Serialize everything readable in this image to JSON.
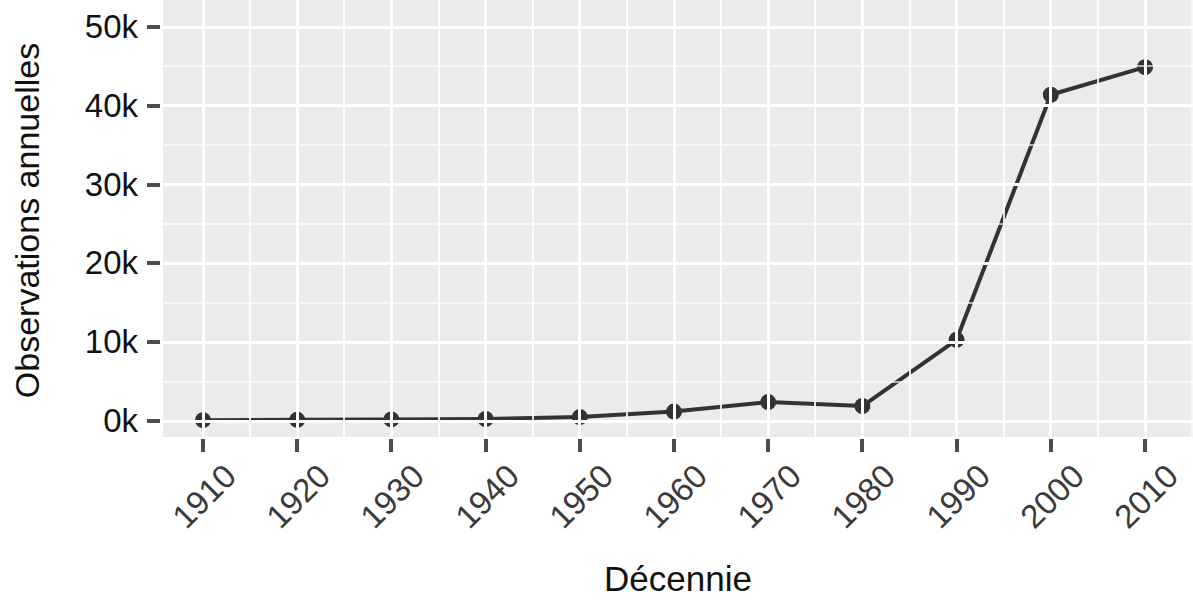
{
  "chart_data": {
    "type": "line",
    "title": "",
    "subtitle": "",
    "xlabel": "Décennie",
    "ylabel": "Observations annuelles",
    "categories": [
      "1910",
      "1920",
      "1930",
      "1940",
      "1950",
      "1960",
      "1970",
      "1980",
      "1990",
      "2000",
      "2010"
    ],
    "x": [
      1910,
      1920,
      1930,
      1940,
      1950,
      1960,
      1970,
      1980,
      1990,
      2000,
      2010
    ],
    "values": [
      100,
      150,
      200,
      250,
      500,
      1200,
      2400,
      1900,
      10300,
      41400,
      44900
    ],
    "series": [
      {
        "name": "Observations annuelles",
        "values": [
          100,
          150,
          200,
          250,
          500,
          1200,
          2400,
          1900,
          10300,
          41400,
          44900
        ]
      }
    ],
    "xlim": [
      1905,
      2015
    ],
    "ylim": [
      -2000,
      53400
    ],
    "ytick_values": [
      0,
      10000,
      20000,
      30000,
      40000,
      50000
    ],
    "ytick_labels": [
      "0k",
      "10k",
      "20k",
      "30k",
      "40k",
      "50k"
    ],
    "xtick_labels": [
      "1910",
      "1920",
      "1930",
      "1940",
      "1950",
      "1960",
      "1970",
      "1980",
      "1990",
      "2000",
      "2010"
    ],
    "xtick_label_rotation": -45,
    "grid": true,
    "grid_major_color": "#ffffff",
    "grid_minor_color": "#ffffff",
    "panel_background": "#ebebeb",
    "figure_background": "#ffffff",
    "line_color": "#333333",
    "point_color": "#333333",
    "line_width": 4,
    "point_radius": 8,
    "legend": "none",
    "markers": "circle"
  },
  "axes": {
    "y_title": "Observations annuelles",
    "x_title": "Décennie",
    "y_ticks": [
      {
        "label": "50k",
        "value": 50000
      },
      {
        "label": "40k",
        "value": 40000
      },
      {
        "label": "30k",
        "value": 30000
      },
      {
        "label": "20k",
        "value": 20000
      },
      {
        "label": "10k",
        "value": 10000
      },
      {
        "label": "0k",
        "value": 0
      }
    ],
    "x_ticks": [
      {
        "label": "1910",
        "value": 1910
      },
      {
        "label": "1920",
        "value": 1920
      },
      {
        "label": "1930",
        "value": 1930
      },
      {
        "label": "1940",
        "value": 1940
      },
      {
        "label": "1950",
        "value": 1950
      },
      {
        "label": "1960",
        "value": 1960
      },
      {
        "label": "1970",
        "value": 1970
      },
      {
        "label": "1980",
        "value": 1980
      },
      {
        "label": "1990",
        "value": 1990
      },
      {
        "label": "2000",
        "value": 2000
      },
      {
        "label": "2010",
        "value": 2010
      }
    ]
  }
}
